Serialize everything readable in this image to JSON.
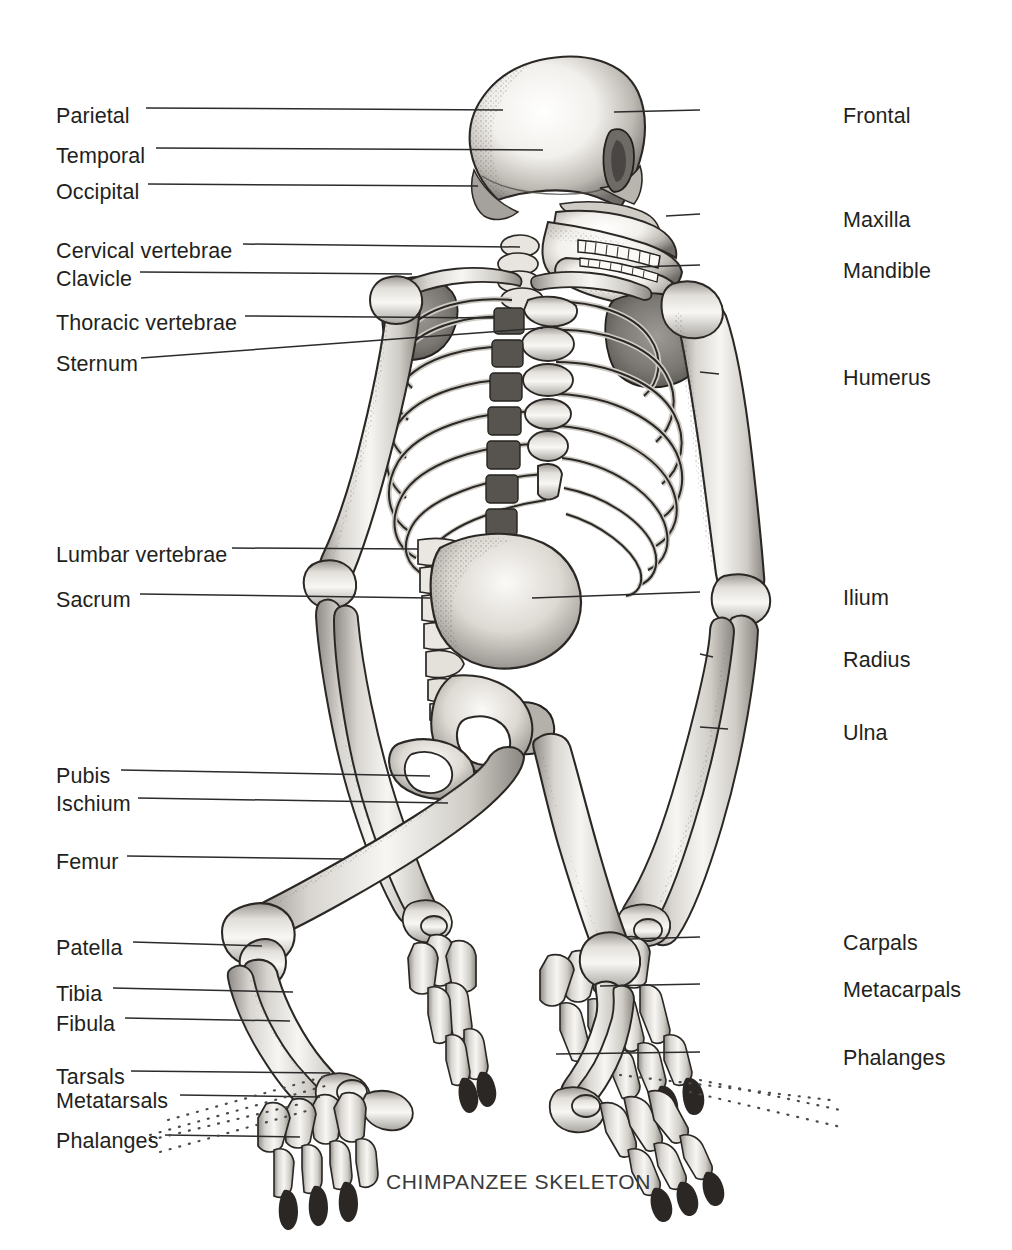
{
  "figure": {
    "caption": "CHIMPANZEE SKELETON",
    "caption_x": 386,
    "caption_y": 1170,
    "background_color": "#ffffff",
    "ink_color": "#231f20",
    "leader_color": "#2b2b2b"
  },
  "labels_left": [
    {
      "text": "Parietal",
      "x": 56,
      "y": 106,
      "line_x1": 146,
      "line_y1": 108,
      "line_x2": 503,
      "line_y2": 110,
      "dotted": false
    },
    {
      "text": "Temporal",
      "x": 56,
      "y": 146,
      "line_x1": 156,
      "line_y1": 148,
      "line_x2": 543,
      "line_y2": 150,
      "dotted": false
    },
    {
      "text": "Occipital",
      "x": 56,
      "y": 182,
      "line_x1": 148,
      "line_y1": 184,
      "line_x2": 478,
      "line_y2": 186,
      "dotted": false
    },
    {
      "text": "Cervical vertebrae",
      "x": 56,
      "y": 241,
      "line_x1": 243,
      "line_y1": 244,
      "line_x2": 520,
      "line_y2": 247,
      "dotted": false
    },
    {
      "text": "Clavicle",
      "x": 56,
      "y": 269,
      "line_x1": 140,
      "line_y1": 272,
      "line_x2": 412,
      "line_y2": 274,
      "dotted": false
    },
    {
      "text": "Thoracic vertebrae",
      "x": 56,
      "y": 313,
      "line_x1": 245,
      "line_y1": 316,
      "line_x2": 495,
      "line_y2": 318,
      "dotted": false
    },
    {
      "text": "Sternum",
      "x": 56,
      "y": 354,
      "line_x1": 141,
      "line_y1": 358,
      "line_x2": 543,
      "line_y2": 328,
      "dotted": false
    },
    {
      "text": "Lumbar vertebrae",
      "x": 56,
      "y": 545,
      "line_x1": 232,
      "line_y1": 548,
      "line_x2": 418,
      "line_y2": 549,
      "dotted": false
    },
    {
      "text": "Sacrum",
      "x": 56,
      "y": 590,
      "line_x1": 140,
      "line_y1": 594,
      "line_x2": 430,
      "line_y2": 598,
      "dotted": false
    },
    {
      "text": "Pubis",
      "x": 56,
      "y": 766,
      "line_x1": 121,
      "line_y1": 770,
      "line_x2": 430,
      "line_y2": 776,
      "dotted": false
    },
    {
      "text": "Ischium",
      "x": 56,
      "y": 794,
      "line_x1": 138,
      "line_y1": 798,
      "line_x2": 448,
      "line_y2": 803,
      "dotted": false
    },
    {
      "text": "Femur",
      "x": 56,
      "y": 852,
      "line_x1": 127,
      "line_y1": 856,
      "line_x2": 345,
      "line_y2": 859,
      "dotted": false
    },
    {
      "text": "Patella",
      "x": 56,
      "y": 938,
      "line_x1": 133,
      "line_y1": 942,
      "line_x2": 262,
      "line_y2": 946,
      "dotted": false
    },
    {
      "text": "Tibia",
      "x": 56,
      "y": 984,
      "line_x1": 113,
      "line_y1": 988,
      "line_x2": 293,
      "line_y2": 992,
      "dotted": false
    },
    {
      "text": "Fibula",
      "x": 56,
      "y": 1014,
      "line_x1": 125,
      "line_y1": 1018,
      "line_x2": 290,
      "line_y2": 1021,
      "dotted": false
    },
    {
      "text": "Tarsals",
      "x": 56,
      "y": 1067,
      "line_x1": 131,
      "line_y1": 1071,
      "line_x2": 330,
      "line_y2": 1073,
      "dotted": false
    },
    {
      "text": "Metatarsals",
      "x": 56,
      "y": 1091,
      "line_x1": 180,
      "line_y1": 1095,
      "line_x2": 320,
      "line_y2": 1097,
      "dotted": false
    },
    {
      "text": "Phalanges",
      "x": 56,
      "y": 1131,
      "line_x1": 165,
      "line_y1": 1135,
      "line_x2": 300,
      "line_y2": 1137,
      "dotted": false
    }
  ],
  "labels_right": [
    {
      "text": "Frontal",
      "x": 843,
      "y": 106,
      "line_x1": 700,
      "line_y1": 110,
      "line_x2": 614,
      "line_y2": 112,
      "dotted": false
    },
    {
      "text": "Maxilla",
      "x": 843,
      "y": 210,
      "line_x1": 700,
      "line_y1": 214,
      "line_x2": 666,
      "line_y2": 216,
      "dotted": false
    },
    {
      "text": "Mandible",
      "x": 843,
      "y": 261,
      "line_x1": 700,
      "line_y1": 265,
      "line_x2": 635,
      "line_y2": 267,
      "dotted": false
    },
    {
      "text": "Humerus",
      "x": 843,
      "y": 368,
      "line_x1": 700,
      "line_y1": 372,
      "line_x2": 719,
      "line_y2": 374,
      "dotted": false
    },
    {
      "text": "Ilium",
      "x": 843,
      "y": 588,
      "line_x1": 700,
      "line_y1": 592,
      "line_x2": 532,
      "line_y2": 598,
      "dotted": false
    },
    {
      "text": "Radius",
      "x": 843,
      "y": 650,
      "line_x1": 700,
      "line_y1": 654,
      "line_x2": 713,
      "line_y2": 657,
      "dotted": false
    },
    {
      "text": "Ulna",
      "x": 843,
      "y": 723,
      "line_x1": 700,
      "line_y1": 727,
      "line_x2": 728,
      "line_y2": 729,
      "dotted": false
    },
    {
      "text": "Carpals",
      "x": 843,
      "y": 933,
      "line_x1": 700,
      "line_y1": 937,
      "line_x2": 630,
      "line_y2": 939,
      "dotted": false
    },
    {
      "text": "Metacarpals",
      "x": 843,
      "y": 980,
      "line_x1": 700,
      "line_y1": 984,
      "line_x2": 600,
      "line_y2": 986,
      "dotted": false
    },
    {
      "text": "Phalanges",
      "x": 843,
      "y": 1048,
      "line_x1": 700,
      "line_y1": 1052,
      "line_x2": 556,
      "line_y2": 1054,
      "dotted": false
    }
  ],
  "dotted_leaders": [
    {
      "name": "foot-tarsals-fan-1",
      "x1": 168,
      "y1": 1120,
      "x2": 330,
      "y2": 1075
    },
    {
      "name": "foot-tarsals-fan-2",
      "x1": 150,
      "y1": 1135,
      "x2": 325,
      "y2": 1086
    },
    {
      "name": "foot-phalanges-fan-1",
      "x1": 150,
      "y1": 1140,
      "x2": 300,
      "y2": 1104
    },
    {
      "name": "foot-phalanges-fan-2",
      "x1": 160,
      "y1": 1152,
      "x2": 310,
      "y2": 1110
    },
    {
      "name": "hand-phalanges-fan-1",
      "x1": 700,
      "y1": 1080,
      "x2": 840,
      "y2": 1110
    },
    {
      "name": "hand-phalanges-fan-2",
      "x1": 690,
      "y1": 1092,
      "x2": 845,
      "y2": 1128
    },
    {
      "name": "hand-phalanges-fan-3",
      "x1": 620,
      "y1": 1075,
      "x2": 830,
      "y2": 1100
    }
  ],
  "skeleton": {
    "title": "chimpanzee skeleton anatomical illustration",
    "view": "anterior oblique, quadrupedal knuckle-walking posture",
    "regions": [
      "skull",
      "cervical vertebrae",
      "clavicle",
      "scapula",
      "rib cage",
      "sternum",
      "thoracic vertebrae",
      "lumbar vertebrae",
      "sacrum",
      "pelvis",
      "humerus",
      "radius",
      "ulna",
      "carpals",
      "metacarpals",
      "hand phalanges",
      "femur",
      "patella",
      "tibia",
      "fibula",
      "tarsals",
      "metatarsals",
      "foot phalanges"
    ]
  }
}
